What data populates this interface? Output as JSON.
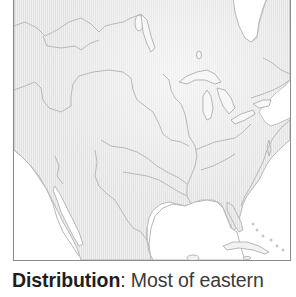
{
  "map": {
    "region": "North America (eastern & central US, southern Canada, Mexico, Caribbean)",
    "style": "light gray outline map with hatched land fill",
    "colors": {
      "outline": "#b5b5b5",
      "land_fill": "#ececec",
      "hatch": "#dedede",
      "frame": "#8a8a8a",
      "water": "#ffffff"
    }
  },
  "caption": {
    "label": "Distribution",
    "separator": ": ",
    "text": "Most of eastern"
  }
}
